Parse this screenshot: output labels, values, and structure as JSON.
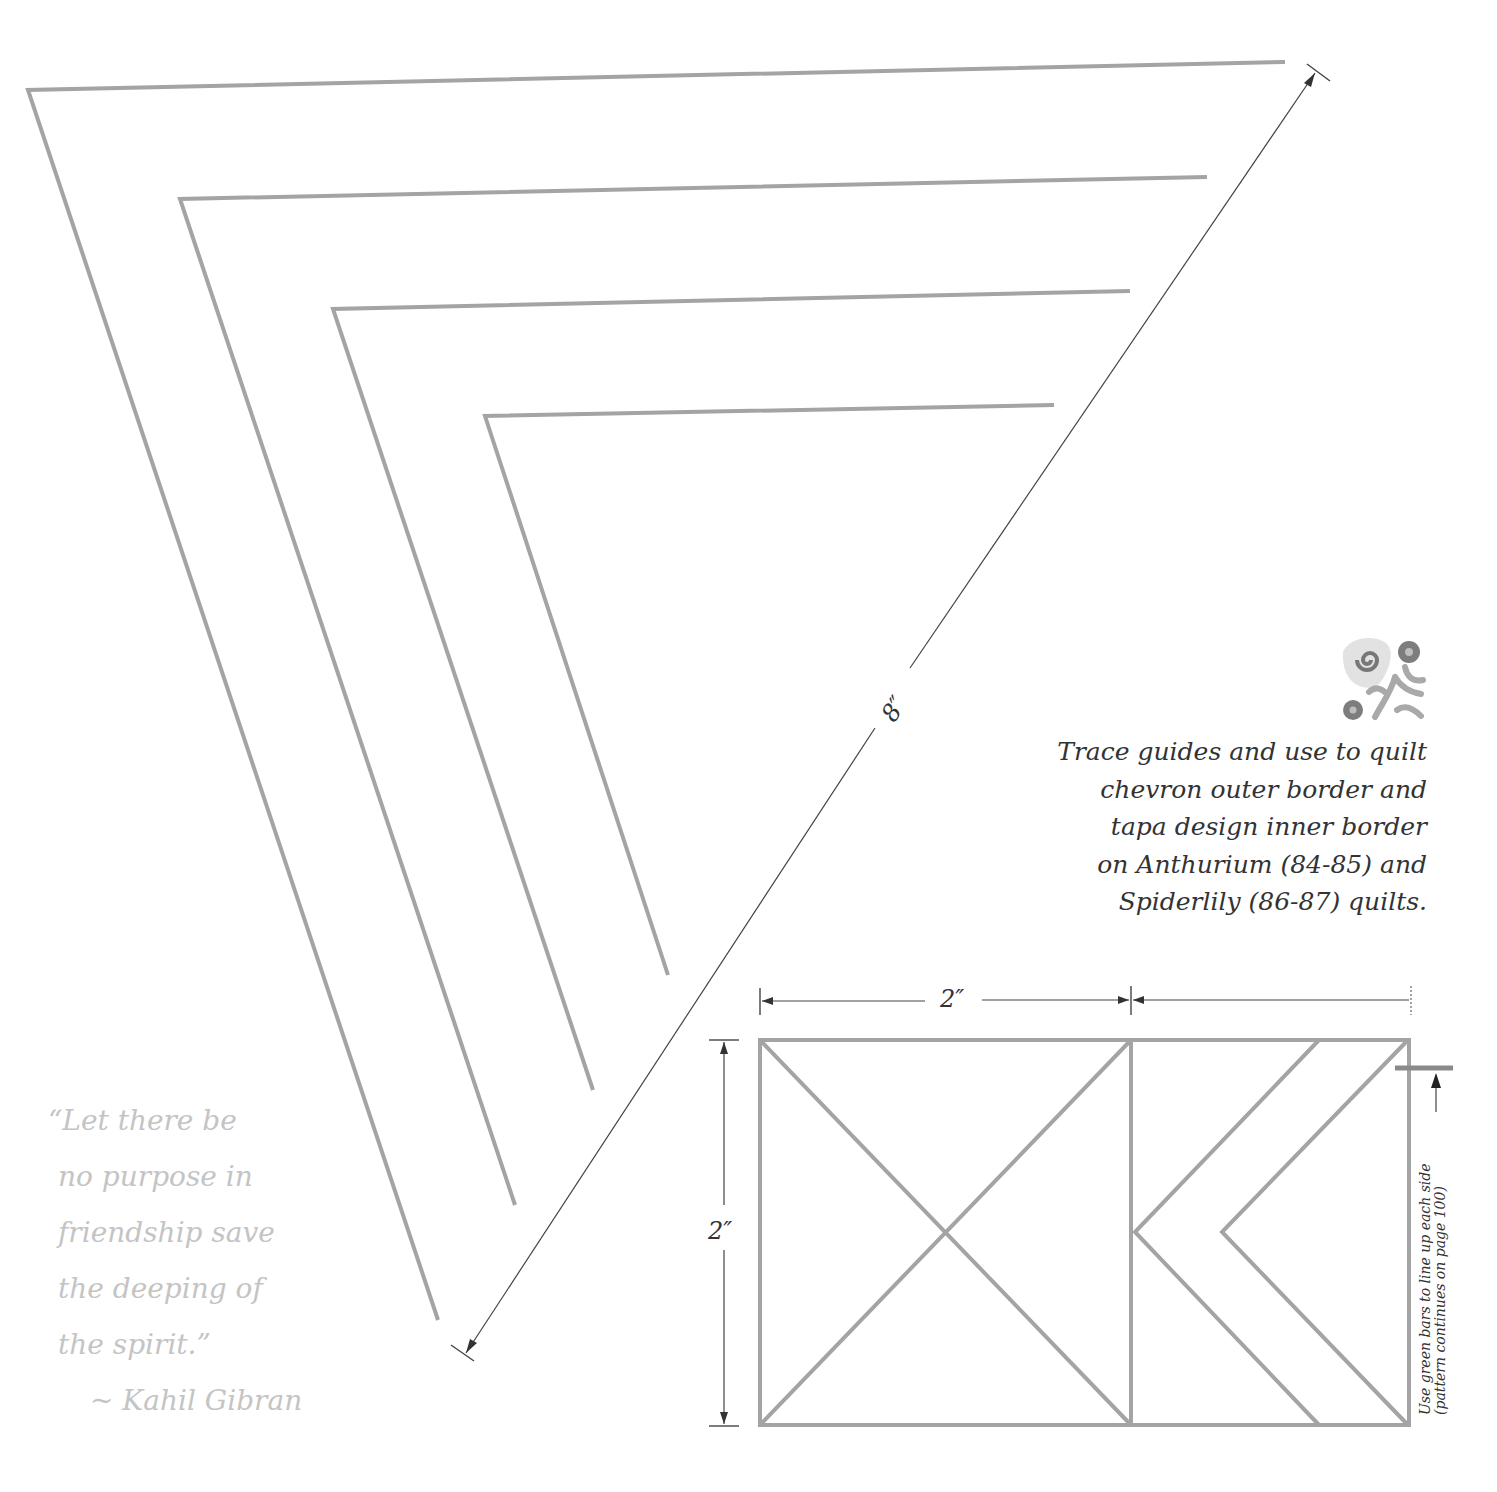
{
  "template": {
    "chevron_guides_count": 4,
    "dimension_diagonal": "8″",
    "dimension_width": "2″",
    "dimension_height": "2″"
  },
  "instructions": {
    "lines": [
      "Trace guides and use to quilt",
      "chevron outer border and",
      "tapa design inner border",
      "on Anthurium (84-85) and",
      "Spiderlily (86-87) quilts."
    ]
  },
  "quote": {
    "lines": [
      "“Let there be",
      "no purpose in",
      "friendship save",
      "the deeping of",
      "the spirit.”"
    ],
    "author": "~ Kahil Gibran"
  },
  "block_note": {
    "line1": "Use green bars to line up each side",
    "line2": "(pattern continues on page 100)"
  },
  "icons": {
    "motif": "tapa-flower-swirl-icon"
  },
  "colors": {
    "guide_line": "#a4a4a4",
    "text": "#333333",
    "quote_text": "#c4c4c4",
    "dimension_line": "#444444"
  }
}
